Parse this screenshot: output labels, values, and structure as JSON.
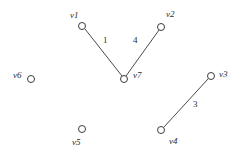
{
  "figure": {
    "type": "graph-diagram",
    "background_color": "#ffffff",
    "stroke_color": "#4a4a4a",
    "text_color": "#2b2b2b",
    "width": 241,
    "height": 156
  },
  "chart_data": {
    "type": "diagram",
    "title": "",
    "xlabel": "",
    "ylabel": "",
    "nodes": [
      {
        "id": "v1",
        "label": "v1",
        "cx": 82,
        "cy": 26,
        "r": 3.5,
        "label_x": 70,
        "label_y": 11
      },
      {
        "id": "v2",
        "label": "v2",
        "cx": 161,
        "cy": 27,
        "r": 3.5,
        "label_x": 166,
        "label_y": 10
      },
      {
        "id": "v3",
        "label": "v3",
        "cx": 211,
        "cy": 76,
        "r": 3.5,
        "label_x": 219,
        "label_y": 70
      },
      {
        "id": "v4",
        "label": "v4",
        "cx": 161,
        "cy": 130,
        "r": 3.5,
        "label_x": 169,
        "label_y": 137
      },
      {
        "id": "v5",
        "label": "v5",
        "cx": 82,
        "cy": 129,
        "r": 3.5,
        "label_x": 72,
        "label_y": 138
      },
      {
        "id": "v6",
        "label": "v6",
        "cx": 31,
        "cy": 79,
        "r": 3.5,
        "label_x": 13,
        "label_y": 71
      },
      {
        "id": "v7",
        "label": "v7",
        "cx": 124,
        "cy": 79,
        "r": 3.5,
        "label_x": 133,
        "label_y": 71
      }
    ],
    "edges": [
      {
        "from": "v1",
        "to": "v7",
        "weight": "1",
        "x1": 85,
        "y1": 29,
        "x2": 122,
        "y2": 76,
        "label_x": 103,
        "label_y": 36
      },
      {
        "from": "v7",
        "to": "v2",
        "weight": "4",
        "x1": 126,
        "y1": 76,
        "x2": 159,
        "y2": 30,
        "label_x": 133,
        "label_y": 36
      },
      {
        "from": "v4",
        "to": "v3",
        "weight": "3",
        "x1": 164,
        "y1": 127,
        "x2": 208,
        "y2": 79,
        "label_x": 193,
        "label_y": 100
      }
    ],
    "isolated_nodes": [
      "v5",
      "v6"
    ],
    "legend": [],
    "annotations": []
  }
}
